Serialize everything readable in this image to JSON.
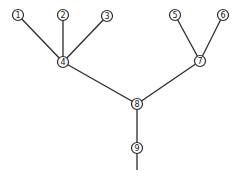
{
  "diagram": {
    "type": "tree",
    "colors": {
      "stroke": "#2a2a2a",
      "background": "#ffffff",
      "text": "#1a1a1a"
    },
    "node_radius": 5.5,
    "nodes": [
      {
        "id": "1",
        "label": "1",
        "x": 18,
        "y": 15
      },
      {
        "id": "2",
        "label": "2",
        "x": 63,
        "y": 15
      },
      {
        "id": "3",
        "label": "3",
        "x": 107,
        "y": 16
      },
      {
        "id": "4",
        "label": "4",
        "x": 63,
        "y": 62
      },
      {
        "id": "5",
        "label": "5",
        "x": 175,
        "y": 15
      },
      {
        "id": "6",
        "label": "6",
        "x": 223,
        "y": 15
      },
      {
        "id": "7",
        "label": "7",
        "x": 200,
        "y": 61
      },
      {
        "id": "8",
        "label": "8",
        "x": 137,
        "y": 104
      },
      {
        "id": "9",
        "label": "9",
        "x": 137,
        "y": 148
      }
    ],
    "edges": [
      {
        "from": "1",
        "to": "4"
      },
      {
        "from": "2",
        "to": "4"
      },
      {
        "from": "3",
        "to": "4"
      },
      {
        "from": "5",
        "to": "7"
      },
      {
        "from": "6",
        "to": "7"
      },
      {
        "from": "4",
        "to": "8"
      },
      {
        "from": "7",
        "to": "8"
      },
      {
        "from": "8",
        "to": "9"
      }
    ],
    "root_stem": {
      "from": "9",
      "to_x": 137,
      "to_y": 170
    }
  }
}
